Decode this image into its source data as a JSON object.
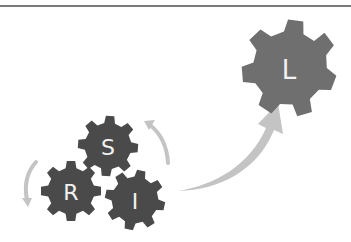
{
  "colors": {
    "gear_dark": "#4a4a4a",
    "gear_light": "#6f6f6f",
    "arrow": "#c4c4c4",
    "rule": "#7a7a7a",
    "label": "#f2f2f2"
  },
  "gears": [
    {
      "label": "S",
      "name": "gear-s"
    },
    {
      "label": "R",
      "name": "gear-r"
    },
    {
      "label": "I",
      "name": "gear-i"
    },
    {
      "label": "L",
      "name": "gear-l"
    }
  ],
  "arrows": [
    {
      "name": "cycle-arrow-right",
      "direction": "up-left"
    },
    {
      "name": "cycle-arrow-left",
      "direction": "down"
    },
    {
      "name": "growth-arrow",
      "direction": "up-right"
    }
  ]
}
